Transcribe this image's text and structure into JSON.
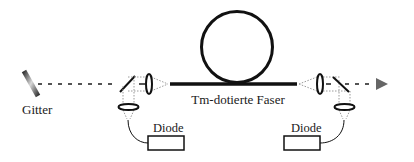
{
  "diagram": {
    "labels": {
      "grating": "Gitter",
      "fiber": "Tm-dotierte Faser",
      "diode_left": "Diode",
      "diode_right": "Diode"
    },
    "colors": {
      "line": "#111111",
      "beam": "#555555",
      "pump_beam": "#9a9a9a",
      "arrow": "#666666",
      "background": "#ffffff"
    },
    "components": [
      {
        "id": "grating",
        "type": "diffraction-grating",
        "label": "Gitter"
      },
      {
        "id": "mirror-left",
        "type": "dichroic-mirror"
      },
      {
        "id": "lens-left",
        "type": "coupling-lens"
      },
      {
        "id": "pump-lens-left",
        "type": "pump-lens"
      },
      {
        "id": "diode-left",
        "type": "pump-diode",
        "label": "Diode"
      },
      {
        "id": "fiber",
        "type": "fiber-coil",
        "label": "Tm-dotierte Faser"
      },
      {
        "id": "lens-right",
        "type": "coupling-lens"
      },
      {
        "id": "mirror-right",
        "type": "dichroic-mirror"
      },
      {
        "id": "pump-lens-right",
        "type": "pump-lens"
      },
      {
        "id": "diode-right",
        "type": "pump-diode",
        "label": "Diode"
      },
      {
        "id": "output",
        "type": "output-arrow"
      }
    ]
  }
}
